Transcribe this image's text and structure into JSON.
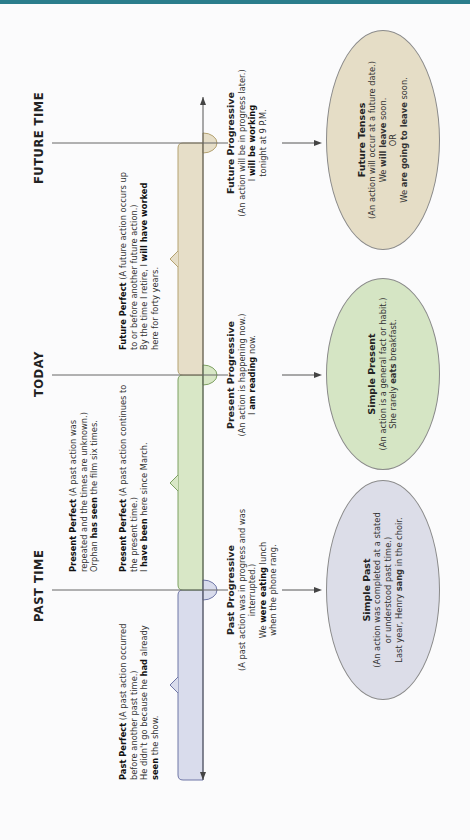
{
  "colors": {
    "top_bar": "#2b7d8c",
    "past": "#d9dcec",
    "present": "#d8e7c6",
    "future": "#e6dec8",
    "axis": "#555555"
  },
  "headers": {
    "past": "PAST TIME",
    "today": "TODAY",
    "future": "FUTURE TIME"
  },
  "above_timeline": {
    "past_perfect": {
      "title": "Past Perfect",
      "desc": " (A past action occurred before another past time.)",
      "ex_pre": "He didn't go because he ",
      "ex_bold1": "had",
      "ex_mid": " already ",
      "ex_bold2": "seen",
      "ex_post": " the show."
    },
    "present_perfect_1": {
      "title": "Present Perfect",
      "desc": " (A past action was repeated and the times are unknown.)",
      "ex_pre": "Orphan ",
      "ex_bold": "has seen",
      "ex_post": " the film six times."
    },
    "present_perfect_2": {
      "title": "Present Perfect",
      "desc": " (A past action continues to the present time.)",
      "ex_pre": "I ",
      "ex_bold": "have been",
      "ex_post": " here since March."
    },
    "future_perfect": {
      "title": "Future Perfect",
      "desc": " (A future action occurs up to or before another future action.)",
      "ex_pre": "By the time I retire, I ",
      "ex_bold": "will have worked",
      "ex_post": " here for forty years."
    }
  },
  "below_timeline": {
    "past_progressive": {
      "title": "Past Progressive",
      "desc": "(A past action was in progress and was interrupted.)",
      "ex_pre": "We ",
      "ex_bold": "were eating",
      "ex_post": " lunch",
      "ex_line2": "when the phone rang."
    },
    "present_progressive": {
      "title": "Present Progressive",
      "desc": "(An action is happening now.)",
      "ex_pre": "I ",
      "ex_bold": "am reading",
      "ex_post": " now."
    },
    "future_progressive": {
      "title": "Future Progressive",
      "desc": "(An action will be in progress later.)",
      "ex_pre": "I ",
      "ex_bold": "will be working",
      "ex_line2": "tonight at 9 P.M."
    }
  },
  "ellipses": {
    "simple_past": {
      "title": "Simple Past",
      "desc1": "(An action was completed at a stated",
      "desc2": "or understood past time.)",
      "ex_pre": "Last year, Henry ",
      "ex_bold": "sang",
      "ex_post": " in the choir."
    },
    "simple_present": {
      "title": "Simple Present",
      "desc": "(An action is a general fact or habit.)",
      "ex_pre": "She rarely ",
      "ex_bold": "eats",
      "ex_post": " breakfast."
    },
    "future_tenses": {
      "title": "Future Tenses",
      "desc": "(An action will occur at a future date.)",
      "ex1_pre": "We ",
      "ex1_bold": "will leave",
      "ex1_post": " soon.",
      "or": "OR",
      "ex2_pre": "We ",
      "ex2_bold": "are going to leave",
      "ex2_post": " soon."
    }
  }
}
